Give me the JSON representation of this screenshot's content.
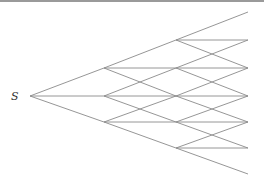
{
  "diagram": {
    "type": "trinomial-tree",
    "root_label": "S",
    "line_color": "#8a8a8a",
    "columns": [
      {
        "x": 30,
        "nodes": [
          96
        ]
      },
      {
        "x": 104,
        "nodes": [
          68,
          96,
          122
        ]
      },
      {
        "x": 176,
        "nodes": [
          40,
          68,
          96,
          122,
          148
        ]
      },
      {
        "x": 248,
        "nodes": [
          12,
          40,
          68,
          96,
          122,
          148,
          174
        ]
      }
    ]
  }
}
